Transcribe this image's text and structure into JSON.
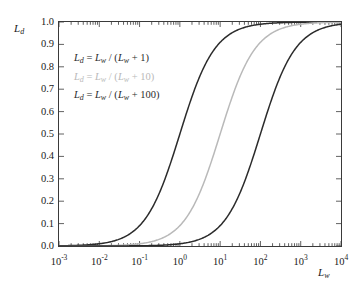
{
  "figure": {
    "background": "#ffffff",
    "frame_color": "#3a3a3a"
  },
  "axes": {
    "y_title": "L",
    "y_title_sub": "d",
    "x_title": "L",
    "x_title_sub": "w",
    "y_ticks": [
      "1.0",
      "0.9",
      "0.8",
      "0.7",
      "0.6",
      "0.5",
      "0.4",
      "0.3",
      "0.2",
      "0.1",
      "0.0"
    ],
    "x_ticks": [
      {
        "mantissa": "10",
        "exponent": "-3"
      },
      {
        "mantissa": "10",
        "exponent": "-2"
      },
      {
        "mantissa": "10",
        "exponent": "-1"
      },
      {
        "mantissa": "10",
        "exponent": "0"
      },
      {
        "mantissa": "10",
        "exponent": "1"
      },
      {
        "mantissa": "10",
        "exponent": "2"
      },
      {
        "mantissa": "10",
        "exponent": "3"
      },
      {
        "mantissa": "10",
        "exponent": "4"
      }
    ]
  },
  "legend": {
    "entries": [
      {
        "text": "L_d = L_w / (L_w + 1)",
        "color": "#2b2b2b",
        "lhs_var": "L",
        "lhs_sub": "d",
        "num_var": "L",
        "num_sub": "w",
        "den_var": "L",
        "den_sub": "w",
        "constant": "1"
      },
      {
        "text": "L_d = L_w / (L_w + 10)",
        "color": "#b9b9b9",
        "lhs_var": "L",
        "lhs_sub": "d",
        "num_var": "L",
        "num_sub": "w",
        "den_var": "L",
        "den_sub": "w",
        "constant": "10"
      },
      {
        "text": "L_d = L_w / (L_w + 100)",
        "color": "#2b2b2b",
        "lhs_var": "L",
        "lhs_sub": "d",
        "num_var": "L",
        "num_sub": "w",
        "den_var": "L",
        "den_sub": "w",
        "constant": "100"
      }
    ]
  },
  "chart_data": {
    "type": "line",
    "title": "",
    "xlabel": "L_w",
    "ylabel": "L_d",
    "x_scale": "log",
    "y_scale": "linear",
    "xlim": [
      0.001,
      10000
    ],
    "ylim": [
      0.0,
      1.0
    ],
    "grid": false,
    "legend_position": "inside-upper-left",
    "y_tick_values": [
      0.0,
      0.1,
      0.2,
      0.3,
      0.4,
      0.5,
      0.6,
      0.7,
      0.8,
      0.9,
      1.0
    ],
    "x_tick_values": [
      0.001,
      0.01,
      0.1,
      1,
      10,
      100,
      1000,
      10000
    ],
    "series": [
      {
        "name": "L_d = L_w / (L_w + 1)",
        "color": "#2b2b2b",
        "k": 1,
        "formula": "Ld = Lw / (Lw + 1)",
        "x": [
          0.001,
          0.00316,
          0.01,
          0.0316,
          0.1,
          0.316,
          1,
          3.16,
          10,
          31.6,
          100,
          316,
          1000,
          3160,
          10000
        ],
        "y": [
          0.000999,
          0.00315,
          0.0099,
          0.03063,
          0.0909,
          0.2402,
          0.5,
          0.7596,
          0.9091,
          0.9694,
          0.9901,
          0.9968,
          0.999,
          0.9997,
          0.9999
        ]
      },
      {
        "name": "L_d = L_w / (L_w + 10)",
        "color": "#b9b9b9",
        "k": 10,
        "formula": "Ld = Lw / (Lw + 10)",
        "x": [
          0.001,
          0.00316,
          0.01,
          0.0316,
          0.1,
          0.316,
          1,
          3.16,
          10,
          31.6,
          100,
          316,
          1000,
          3160,
          10000
        ],
        "y": [
          0.0001,
          0.000316,
          0.000999,
          0.00315,
          0.0099,
          0.03063,
          0.0909,
          0.2402,
          0.5,
          0.7596,
          0.9091,
          0.9694,
          0.9901,
          0.9968,
          0.999
        ]
      },
      {
        "name": "L_d = L_w / (L_w + 100)",
        "color": "#2b2b2b",
        "k": 100,
        "formula": "Ld = Lw / (Lw + 100)",
        "x": [
          0.001,
          0.00316,
          0.01,
          0.0316,
          0.1,
          0.316,
          1,
          3.16,
          10,
          31.6,
          100,
          316,
          1000,
          3160,
          10000
        ],
        "y": [
          1e-05,
          3.16e-05,
          0.0001,
          0.000316,
          0.000999,
          0.00315,
          0.0099,
          0.03063,
          0.0909,
          0.2402,
          0.5,
          0.7596,
          0.9091,
          0.9694,
          0.9901
        ]
      }
    ]
  }
}
